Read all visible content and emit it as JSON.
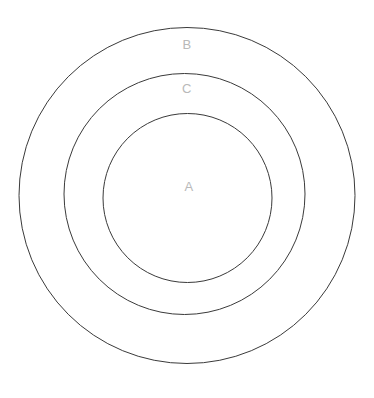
{
  "diagram": {
    "type": "concentric-circles",
    "background_color": "#ffffff",
    "stroke_color": "#3a3a3a",
    "label_color": "#b9b9b9",
    "stroke_width": 1,
    "regions": [
      {
        "id": "outer",
        "label": "B",
        "center_x": 187,
        "center_y": 195.5,
        "radius": 168,
        "label_x": 187,
        "label_y": 46,
        "fill": "none"
      },
      {
        "id": "middle",
        "label": "C",
        "center_x": 184.5,
        "center_y": 194,
        "radius": 120.5,
        "label_x": 187,
        "label_y": 90,
        "fill": "none"
      },
      {
        "id": "inner",
        "label": "A",
        "center_x": 187.5,
        "center_y": 198,
        "radius": 84.5,
        "label_x": 189,
        "label_y": 188,
        "fill": "none"
      }
    ]
  },
  "labels": {
    "outer_ring": "B",
    "middle_ring": "C",
    "inner_circle": "A"
  }
}
